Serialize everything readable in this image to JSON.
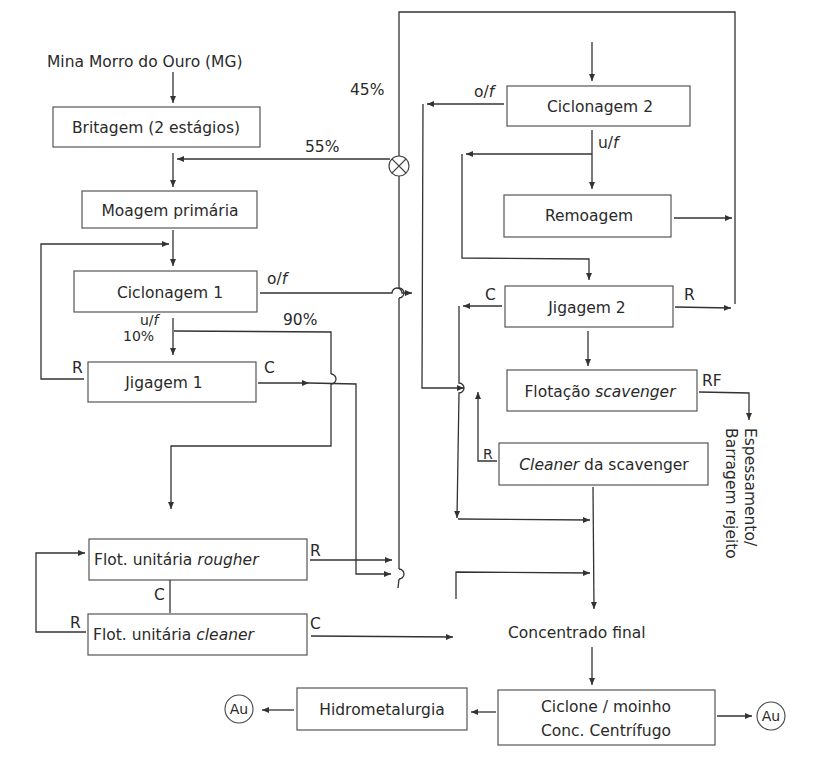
{
  "diagram": {
    "source": "Mina Morro do Ouro (MG)",
    "nodes": {
      "britagem": "Britagem (2 estágios)",
      "moagem": "Moagem primária",
      "ciclonagem1": "Ciclonagem 1",
      "jigagem1": "Jigagem 1",
      "ciclonagem2": "Ciclonagem 2",
      "remoagem": "Remoagem",
      "jigagem2": "Jigagem 2",
      "flot_scav_a": "Flotação ",
      "flot_scav_b": "scavenger",
      "cleaner_scav_a": "Cleaner",
      "cleaner_scav_b": " da scavenger",
      "rougher_a": "Flot. unitária ",
      "rougher_b": "rougher",
      "cleaner_a": "Flot. unitária ",
      "cleaner_b": "cleaner",
      "concentrado": "Concentrado final",
      "ciclone_l1": "Ciclone / moinho",
      "ciclone_l2": "Conc. Centrífugo",
      "hidro": "Hidrometalurgia",
      "au_left": "Au",
      "au_right": "Au",
      "rejeito_l1": "Espessamento/",
      "rejeito_l2": "Barragem rejeito"
    },
    "labels": {
      "p45": "45%",
      "p55": "55%",
      "p90": "90%",
      "p10": "10%",
      "of1": "o/",
      "of2": "o/",
      "uf1": "u/",
      "uf2": "u/",
      "f": "f",
      "r_jig1": "R",
      "c_jig1": "C",
      "c_jig2": "C",
      "r_jig2": "R",
      "rf": "RF",
      "r_cleaner_scav": "R",
      "r_rougher": "R",
      "c_rougher": "C",
      "r_cleaner": "R",
      "c_cleaner": "C"
    },
    "colors": {
      "line": "#333333",
      "box_border": "#555555",
      "text": "#2a2a2a"
    }
  }
}
